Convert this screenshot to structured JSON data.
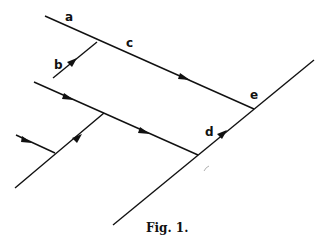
{
  "figure": {
    "caption": "Fig. 1.",
    "labels": {
      "a": "a",
      "b": "b",
      "c": "c",
      "d": "d",
      "e": "e"
    },
    "line_color": "#111111",
    "background": "#ffffff"
  }
}
